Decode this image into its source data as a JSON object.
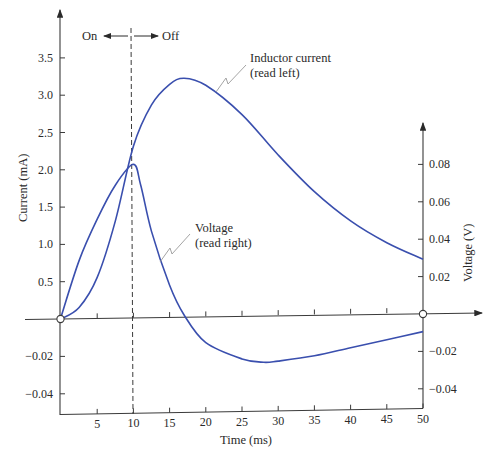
{
  "chart_data": {
    "type": "line",
    "title": "",
    "xlabel": "Time (ms)",
    "ylabel_left": "Current (mA)",
    "ylabel_right": "Voltage (V)",
    "xlim": [
      0,
      50
    ],
    "ylim_left": [
      -0.05,
      3.9
    ],
    "ylim_right": [
      -0.05,
      0.1
    ],
    "x_ticks": [
      5,
      10,
      15,
      20,
      25,
      30,
      35,
      40,
      45,
      50
    ],
    "left_ticks_positive": [
      "0.5",
      "1.0",
      "1.5",
      "2.0",
      "2.5",
      "3.0",
      "3.5"
    ],
    "left_ticks_negative": [
      "-0.02",
      "-0.04"
    ],
    "right_ticks_positive": [
      "0.02",
      "0.04",
      "0.06",
      "0.08"
    ],
    "right_ticks_negative": [
      "-0.02",
      "-0.04"
    ],
    "grid": false,
    "vertical_marker": {
      "x": 10,
      "style": "dashed",
      "left_label": "On",
      "right_label": "Off"
    },
    "series": [
      {
        "name": "Inductor current",
        "annotation": [
          "Inductor current",
          "(read left)"
        ],
        "axis": "left",
        "unit": "mA",
        "x": [
          0,
          2.5,
          5,
          7.5,
          10,
          12.5,
          15,
          17,
          20,
          25,
          30,
          35,
          40,
          45,
          50
        ],
        "values": [
          0,
          0.15,
          0.55,
          1.3,
          2.3,
          2.85,
          3.12,
          3.2,
          3.1,
          2.7,
          2.15,
          1.65,
          1.25,
          0.95,
          0.72
        ]
      },
      {
        "name": "Voltage",
        "annotation": [
          "Voltage",
          "(read right)"
        ],
        "axis": "right",
        "unit": "V",
        "x": [
          0,
          2.5,
          5,
          7.5,
          10,
          11,
          12.5,
          15,
          17,
          20,
          25,
          28,
          30,
          35,
          40,
          45,
          50
        ],
        "values": [
          0,
          0.03,
          0.052,
          0.07,
          0.081,
          0.07,
          0.045,
          0.016,
          0,
          -0.015,
          -0.024,
          -0.026,
          -0.0255,
          -0.023,
          -0.019,
          -0.015,
          -0.011
        ]
      }
    ],
    "line_color": "#3a4fae"
  },
  "labels": {
    "on": "On",
    "off": "Off",
    "xlabel": "Time (ms)",
    "ylabel_left": "Current (mA)",
    "ylabel_right": "Voltage (V)",
    "current_annot_1": "Inductor current",
    "current_annot_2": "(read left)",
    "voltage_annot_1": "Voltage",
    "voltage_annot_2": "(read right)"
  }
}
